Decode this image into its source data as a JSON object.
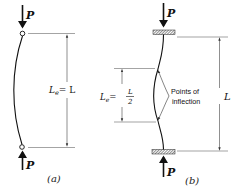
{
  "figure_a": {
    "caption": "(a)",
    "load_top": "P",
    "load_bottom": "P",
    "length_label_main": "L",
    "length_label_sub": "e",
    "length_label_rhs": "= L"
  },
  "figure_b": {
    "caption": "(b)",
    "load_top": "P",
    "load_bottom": "P",
    "total_length_label": "L",
    "effective_label_main": "L",
    "effective_label_sub": "e",
    "effective_label_eq": "=",
    "fraction_num": "L",
    "fraction_den": "2",
    "annotation_line1": "Points of",
    "annotation_line2": "inflection"
  },
  "colors": {
    "ink": "#1a1a1a",
    "dim": "#555555"
  }
}
